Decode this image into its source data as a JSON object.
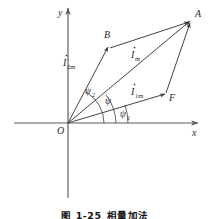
{
  "figure": {
    "caption_number": "图 1-25",
    "caption_title": "相量加法",
    "axes": {
      "x_label": "x",
      "y_label": "y",
      "origin_label": "O"
    },
    "points": [
      {
        "name": "point-a",
        "label": "A",
        "x": 192,
        "y": 18
      },
      {
        "name": "point-b",
        "label": "B",
        "x": 108,
        "y": 42
      },
      {
        "name": "point-f",
        "label": "F",
        "x": 168,
        "y": 97
      },
      {
        "name": "point-o",
        "label": "O",
        "x": 68,
        "y": 123
      }
    ],
    "vectors": [
      {
        "name": "vector-i1m",
        "base": "I",
        "sub": "1m",
        "label": "İ1m",
        "from": "O",
        "to": "F",
        "label_x": 131,
        "label_y": 92
      },
      {
        "name": "vector-i2m",
        "base": "I",
        "sub": "2m",
        "label": "İ2m",
        "from": "O",
        "to": "B",
        "label_x": 63,
        "label_y": 63
      },
      {
        "name": "vector-im",
        "base": "I",
        "sub": "m",
        "label": "İm",
        "from": "O",
        "to": "A",
        "label_x": 131,
        "label_y": 55
      }
    ],
    "angles": [
      {
        "name": "angle-psi1",
        "symbol": "ψ",
        "sub": "1",
        "label_x": 118,
        "label_y": 112
      },
      {
        "name": "angle-psi",
        "symbol": "ψ",
        "sub": "",
        "label_x": 105,
        "label_y": 101
      },
      {
        "name": "angle-psi2",
        "symbol": "ψ",
        "sub": "2",
        "label_x": 87,
        "label_y": 91
      }
    ],
    "colors": {
      "stroke": "#3a3a3a",
      "axis": "#5a5a5a",
      "text": "#2b2b2b",
      "caption": "#121212",
      "background": "#ffffff"
    }
  }
}
